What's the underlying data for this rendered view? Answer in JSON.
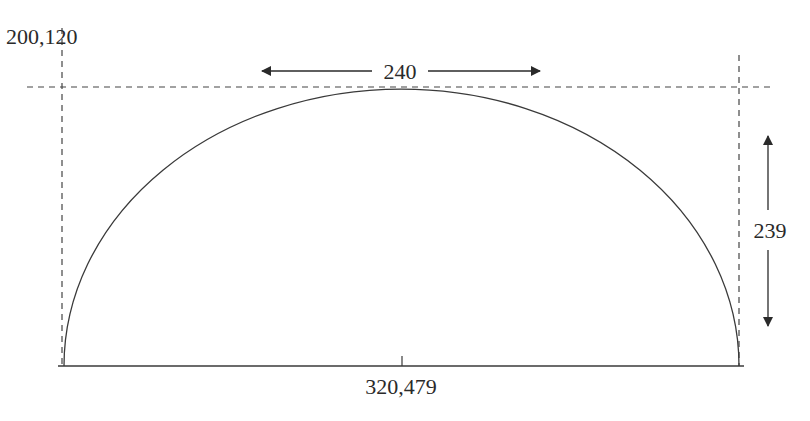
{
  "diagram": {
    "type": "semi-ellipse dimension drawing",
    "labels": {
      "top_left_coord": "200,120",
      "width_dimension": "240",
      "height_dimension": "239",
      "bottom_center_coord": "320,479"
    },
    "colors": {
      "stroke": "#3a3a3a",
      "text": "#2a2a2a",
      "background": "#ffffff"
    }
  }
}
